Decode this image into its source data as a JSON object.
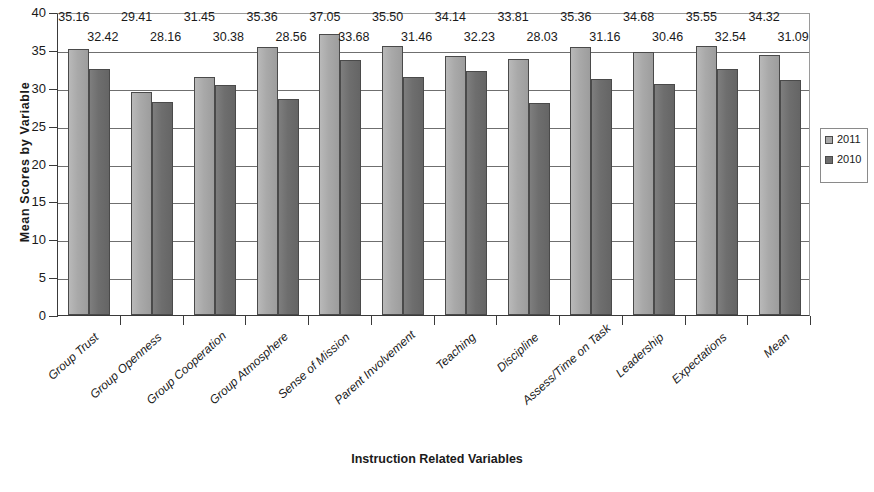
{
  "chart_data": {
    "type": "bar",
    "title": "",
    "xlabel": "Instruction Related Variables",
    "ylabel": "Mean Scores by Variable",
    "ylim": [
      0,
      40
    ],
    "ytick_step": 5,
    "yticks": [
      "0",
      "5",
      "10",
      "15",
      "20",
      "25",
      "30",
      "35",
      "40"
    ],
    "grid": true,
    "legend_position": "right",
    "categories": [
      "Group Trust",
      "Group Openness",
      "Group Cooperation",
      "Group Atmosphere",
      "Sense of Mission",
      "Parent Involvement",
      "Teaching",
      "Discipline",
      "Assess/Time on Task",
      "Leadership",
      "Expectations",
      "Mean"
    ],
    "series": [
      {
        "name": "2011",
        "color": "#a9a9a9",
        "values": [
          35.16,
          29.41,
          31.45,
          35.36,
          37.05,
          35.5,
          34.14,
          33.81,
          35.36,
          34.68,
          35.55,
          34.32
        ],
        "labels": [
          "35.16",
          "29.41",
          "31.45",
          "35.36",
          "37.05",
          "35.50",
          "34.14",
          "33.81",
          "35.36",
          "34.68",
          "35.55",
          "34.32"
        ]
      },
      {
        "name": "2010",
        "color": "#6e6e6e",
        "values": [
          32.42,
          28.16,
          30.38,
          28.56,
          33.68,
          31.46,
          32.23,
          28.03,
          31.16,
          30.46,
          32.54,
          31.09
        ],
        "labels": [
          "32.42",
          "28.16",
          "30.38",
          "28.56",
          "33.68",
          "31.46",
          "32.23",
          "28.03",
          "31.16",
          "30.46",
          "32.54",
          "31.09"
        ]
      }
    ]
  },
  "legend": {
    "items": [
      {
        "label": "2011",
        "swatch": "s2011"
      },
      {
        "label": "2010",
        "swatch": "s2010"
      }
    ]
  }
}
